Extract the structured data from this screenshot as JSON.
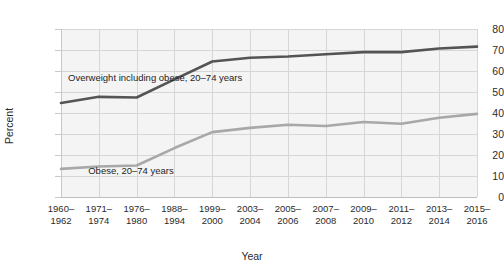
{
  "chart_data": {
    "type": "line",
    "title": "",
    "xlabel": "Year",
    "ylabel": "Percent",
    "ylim": [
      0,
      80
    ],
    "yticks": [
      0,
      10,
      20,
      30,
      40,
      50,
      60,
      70,
      80
    ],
    "grid": true,
    "legend_position": "inline-annotation",
    "categories": [
      "1960–\n1962",
      "1971–\n1974",
      "1976–\n1980",
      "1988–\n1994",
      "1999–\n2000",
      "2003–\n2004",
      "2005–\n2006",
      "2007–\n2008",
      "2009–\n2010",
      "2011–\n2012",
      "2013–\n2014",
      "2015–\n2016"
    ],
    "category_lines": [
      [
        "1960–",
        "1962"
      ],
      [
        "1971–",
        "1974"
      ],
      [
        "1976–",
        "1980"
      ],
      [
        "1988–",
        "1994"
      ],
      [
        "1999–",
        "2000"
      ],
      [
        "2003–",
        "2004"
      ],
      [
        "2005–",
        "2006"
      ],
      [
        "2007–",
        "2008"
      ],
      [
        "2009–",
        "2010"
      ],
      [
        "2011–",
        "2012"
      ],
      [
        "2013–",
        "2014"
      ],
      [
        "2015–",
        "2016"
      ]
    ],
    "series": [
      {
        "name": "Overweight including obese, 20–74 years",
        "color": "#545454",
        "values": [
          44.8,
          47.7,
          47.4,
          56.0,
          64.5,
          66.3,
          66.9,
          68.0,
          69.0,
          69.0,
          70.7,
          71.6
        ]
      },
      {
        "name": "Obese, 20–74 years",
        "color": "#a8a8a8",
        "values": [
          13.4,
          14.5,
          15.0,
          23.3,
          30.9,
          32.9,
          34.4,
          33.8,
          35.7,
          34.9,
          37.7,
          39.6
        ]
      }
    ],
    "annotations": [
      {
        "id": "overweight",
        "line1": "Overweight including obese,",
        "line2": "20–74 years"
      },
      {
        "id": "obese",
        "line1": "Obese, 20–74 years",
        "line2": ""
      }
    ],
    "colors": {
      "overweight_line": "#545454",
      "obese_line": "#a8a8a8",
      "plot_background": "#f4f4f4",
      "grid": "#d6d6d6",
      "text": "#2b2b2b"
    }
  }
}
